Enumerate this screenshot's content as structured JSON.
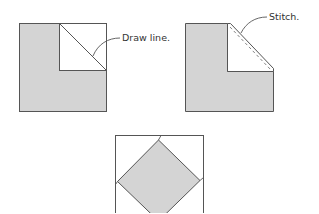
{
  "figure": {
    "colors": {
      "fill": "#d4d4d4",
      "outline": "#555555",
      "background": "#ffffff",
      "text": "#333333"
    },
    "steps": [
      {
        "id": "step-1",
        "description": "Gray square with white square placed in upper-right corner; diagonal line drawn",
        "callout": "Draw line."
      },
      {
        "id": "step-2",
        "description": "Corner stitched along diagonal and folded; white triangle remains",
        "callout": "Stitch."
      },
      {
        "id": "step-3",
        "description": "Finished block: gray diamond (square on point) within white square",
        "callout": ""
      }
    ]
  }
}
